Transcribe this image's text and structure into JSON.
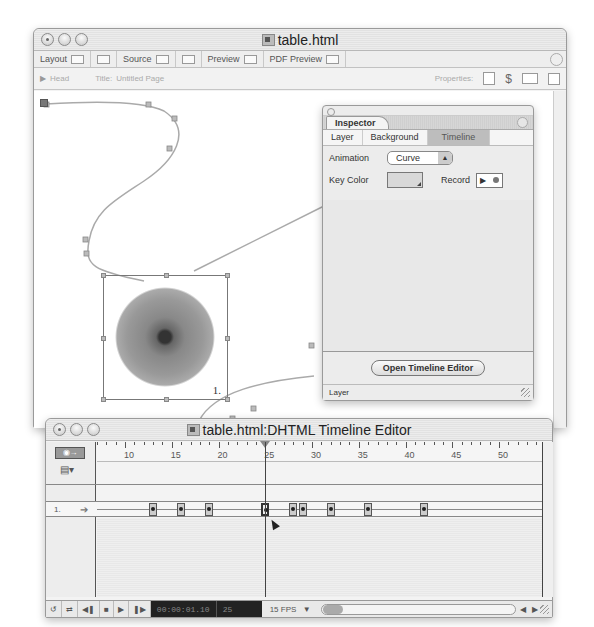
{
  "main_window": {
    "title": "table.html",
    "toolbar": {
      "modes": [
        {
          "label": "Layout"
        },
        {
          "label": ""
        },
        {
          "label": "Source"
        },
        {
          "label": ""
        },
        {
          "label": "Preview"
        },
        {
          "label": "PDF Preview"
        }
      ]
    },
    "header_bar": {
      "head_label": "Head",
      "title_label": "Title:",
      "title_value": "Untitled Page",
      "properties_label": "Properties:"
    },
    "canvas": {
      "layer_number": "1."
    }
  },
  "inspector": {
    "title": "Inspector",
    "tabs": [
      {
        "label": "Layer",
        "active": false
      },
      {
        "label": "Background",
        "active": false
      },
      {
        "label": "Timeline",
        "active": true
      }
    ],
    "animation_label": "Animation",
    "animation_value": "Curve",
    "key_color_label": "Key Color",
    "record_label": "Record",
    "open_timeline_button": "Open Timeline Editor",
    "footer_label": "Layer"
  },
  "timeline_editor": {
    "title": "table.html:DHTML Timeline Editor",
    "ruler_labels": [
      "10",
      "15",
      "20",
      "25",
      "30",
      "35",
      "40",
      "45",
      "50"
    ],
    "playhead_frame": 25,
    "tracks": [
      {
        "label": "1.",
        "keyframes": [
          13,
          16,
          19,
          25,
          28,
          29,
          32,
          36,
          42
        ],
        "selected_keyframe": 25
      }
    ],
    "controls": {
      "timecode": "00:00:01.10",
      "frame": "25",
      "fps": "15 FPS"
    }
  },
  "colors": {
    "window_bg": "#f3f3f3",
    "canvas_bg": "#ffffff",
    "active_tab_bg": "#bdbdbd",
    "lcd_bg": "#222222"
  }
}
